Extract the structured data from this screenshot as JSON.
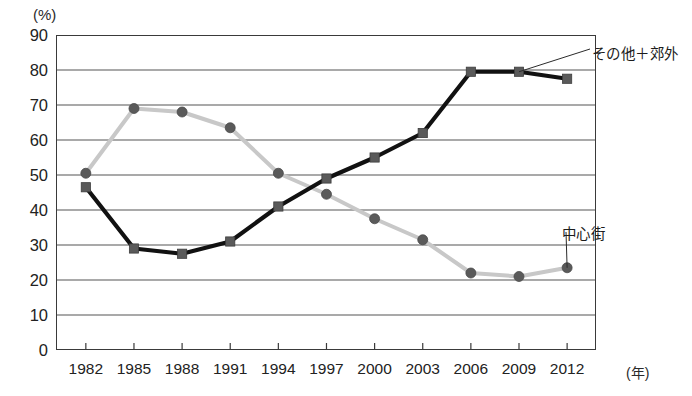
{
  "chart_data": {
    "type": "line",
    "title": "",
    "subtitle": "",
    "xlabel": "(年)",
    "ylabel": "(%)",
    "x": [
      "1982",
      "1985",
      "1988",
      "1991",
      "1994",
      "1997",
      "2000",
      "2003",
      "2006",
      "2009",
      "2012"
    ],
    "categories": [
      "1982",
      "1985",
      "1988",
      "1991",
      "1994",
      "1997",
      "2000",
      "2003",
      "2006",
      "2009",
      "2012"
    ],
    "ylim": [
      0,
      90
    ],
    "yticks": [
      0,
      10,
      20,
      30,
      40,
      50,
      60,
      70,
      80,
      90
    ],
    "ytick_labels": [
      "0",
      "10",
      "20",
      "30",
      "40",
      "50",
      "60",
      "70",
      "80",
      "90"
    ],
    "grid": "horizontal",
    "legend_position": "inline-annotation",
    "series": [
      {
        "name": "その他＋郊外",
        "marker": "square",
        "color": "#111111",
        "values": [
          46.5,
          29,
          27.5,
          31,
          41,
          49,
          55,
          62,
          79.5,
          79.5,
          77.5
        ]
      },
      {
        "name": "中心街",
        "marker": "circle",
        "color": "#c8c8c8",
        "values": [
          50.5,
          69,
          68,
          63.5,
          50.5,
          44.5,
          37.5,
          31.5,
          22,
          21,
          23.5
        ]
      }
    ],
    "annotations": [
      {
        "text": "その他＋郊外",
        "target_series": "その他＋郊外",
        "target_x": "2009"
      },
      {
        "text": "中心街",
        "target_series": "中心街",
        "target_x": "2012"
      }
    ]
  },
  "axis": {
    "y_unit": "(%)",
    "x_unit": "(年)"
  },
  "labels": {
    "series_other_suburb": "その他＋郊外",
    "series_center": "中心街"
  },
  "colors": {
    "series_other_suburb": "#111111",
    "series_center": "#c8c8c8",
    "marker_fill": "#5a5a5a",
    "axis": "#3a3a3a",
    "grid": "#555555",
    "text": "#222222"
  }
}
